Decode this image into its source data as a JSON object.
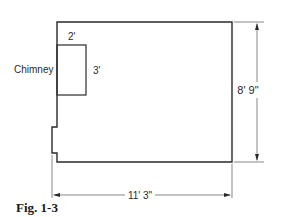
{
  "figure": {
    "caption": "Fig. 1-3",
    "colors": {
      "line": "#2a2a2a",
      "dimension_line": "#555555",
      "background": "#ffffff"
    }
  },
  "room": {
    "width_label": "11' 3\"",
    "height_label": "8' 9\""
  },
  "chimney": {
    "label": "Chimney",
    "width_label": "2'",
    "depth_label": "3'"
  }
}
